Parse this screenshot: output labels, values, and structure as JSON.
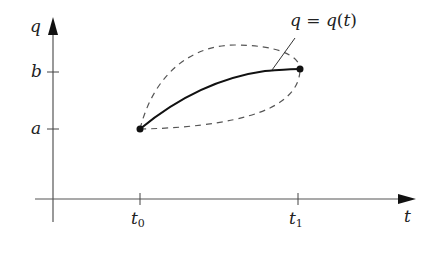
{
  "diagram": {
    "axes": {
      "vertical_label": "q",
      "horizontal_label": "t"
    },
    "vertical_ticks": [
      {
        "label": "b"
      },
      {
        "label": "a"
      }
    ],
    "horizontal_ticks": [
      {
        "label_base": "t",
        "label_sub": "0"
      },
      {
        "label_base": "t",
        "label_sub": "1"
      }
    ],
    "curve_annotation": {
      "lhs": "q",
      "eq": " = ",
      "rhs_fn": "q",
      "rhs_arg_open": "(",
      "rhs_arg": "t",
      "rhs_arg_close": ")"
    },
    "curves": [
      {
        "name": "actual-path",
        "style": "solid"
      },
      {
        "name": "varied-path-upper",
        "style": "dashed"
      },
      {
        "name": "varied-path-lower",
        "style": "dashed"
      }
    ],
    "colors": {
      "axis": "#444444",
      "curve": "#111111",
      "dashed": "#555555"
    }
  }
}
